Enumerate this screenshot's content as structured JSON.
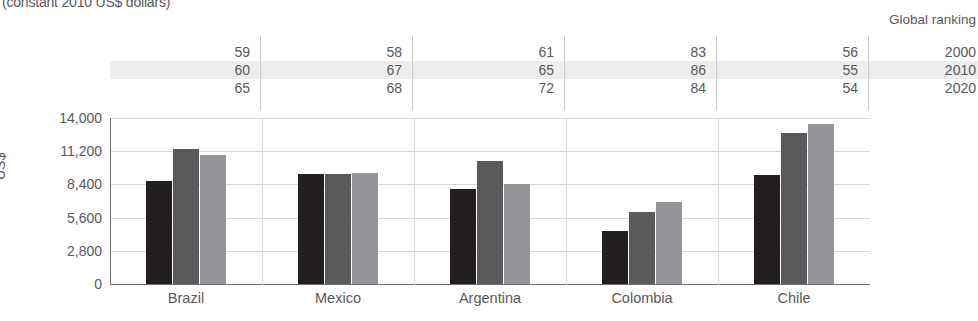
{
  "subtitle": "(constant 2010 US$ dollars)",
  "ranking": {
    "header": "Global ranking",
    "years": [
      "2000",
      "2010",
      "2020"
    ],
    "countries": [
      "Brazil",
      "Mexico",
      "Argentina",
      "Colombia",
      "Chile"
    ],
    "values": [
      [
        59,
        58,
        61,
        83,
        56
      ],
      [
        60,
        67,
        65,
        86,
        55
      ],
      [
        65,
        68,
        72,
        84,
        54
      ]
    ]
  },
  "legend": {
    "items": [
      {
        "label": "2000",
        "color": "#231f20"
      },
      {
        "label": "2010",
        "color": "#58595b"
      },
      {
        "label": "2020",
        "color": "#939598"
      }
    ]
  },
  "chart_data": {
    "type": "bar",
    "title": "",
    "subtitle": "(constant 2010 US$ dollars)",
    "xlabel": "",
    "ylabel": "US$",
    "ylim": [
      0,
      14000
    ],
    "yticks": [
      0,
      2800,
      5600,
      8400,
      11200,
      14000
    ],
    "ytick_labels": [
      "0",
      "2,800",
      "5,600",
      "8,400",
      "11,200",
      "14,000"
    ],
    "grid": true,
    "legend_position": "right",
    "categories": [
      "Brazil",
      "Mexico",
      "Argentina",
      "Colombia",
      "Chile"
    ],
    "series": [
      {
        "name": "2000",
        "color": "#231f20",
        "values": [
          8700,
          9250,
          8050,
          4500,
          9200
        ]
      },
      {
        "name": "2010",
        "color": "#58595b",
        "values": [
          11400,
          9250,
          10350,
          6100,
          12700
        ]
      },
      {
        "name": "2020",
        "color": "#939598",
        "values": [
          10900,
          9350,
          8450,
          6900,
          13500
        ]
      }
    ]
  }
}
